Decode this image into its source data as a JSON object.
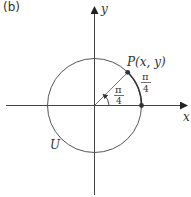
{
  "panel_label": "(b)",
  "axes": {
    "x_label": "x",
    "y_label": "y"
  },
  "circle_label": "U",
  "point_label": "P(x, y)",
  "angle_label": {
    "num": "π",
    "den": "4"
  },
  "arc_label": {
    "num": "π",
    "den": "4"
  },
  "colors": {
    "line": "#444444",
    "point": "#333333",
    "background": "#ffffff"
  }
}
